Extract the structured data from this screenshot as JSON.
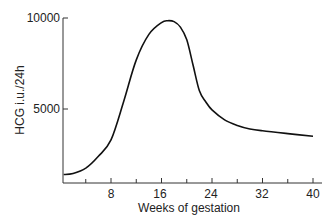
{
  "chart_data": {
    "type": "line",
    "title": "",
    "xlabel": "Weeks of gestation",
    "ylabel": "HCG i.u./24h",
    "xlim": [
      0,
      41
    ],
    "ylim": [
      0,
      10000
    ],
    "x_ticks_major": [
      8,
      16,
      24,
      32,
      40
    ],
    "x_ticks_minor": [
      4,
      12,
      20,
      28,
      36
    ],
    "y_ticks": [
      5000,
      10000
    ],
    "grid": false,
    "legend": null,
    "series": [
      {
        "name": "HCG",
        "x": [
          0.5,
          2,
          4,
          6,
          8,
          10,
          12,
          14,
          16,
          17,
          18,
          19,
          20,
          21,
          22,
          23,
          24,
          26,
          28,
          30,
          32,
          36,
          40
        ],
        "y": [
          1400,
          1450,
          1750,
          2400,
          3300,
          5400,
          7700,
          9100,
          9750,
          9850,
          9800,
          9500,
          8800,
          7400,
          6000,
          5400,
          4950,
          4400,
          4100,
          3900,
          3800,
          3650,
          3500
        ]
      }
    ]
  },
  "labels": {
    "y_tick_10000": "10000",
    "y_tick_5000": "5000",
    "x_tick_8": "8",
    "x_tick_16": "16",
    "x_tick_24": "24",
    "x_tick_32": "32",
    "x_tick_40": "40"
  }
}
